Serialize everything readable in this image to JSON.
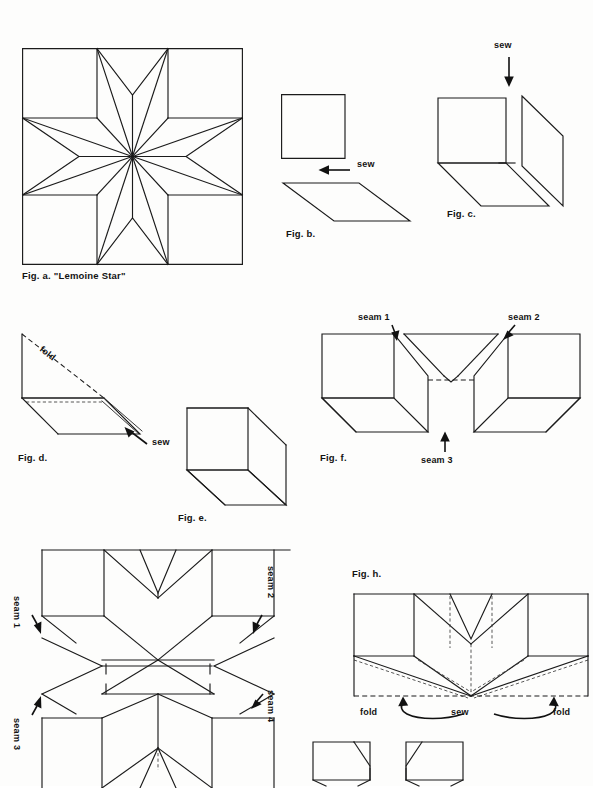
{
  "page": {
    "kind": "instructional-diagram-page",
    "width": 593,
    "height": 786,
    "background_color": "#fdfdfc",
    "ink_color": "#1b1b1b"
  },
  "figures": {
    "a": {
      "caption": "Fig. a. \"Lemoine Star\"",
      "description": "eight-pointed star block in a square with four corner squares and four edge triangles"
    },
    "b": {
      "caption": "Fig. b.",
      "labels": {
        "sew": "sew"
      },
      "description": "a square and a diamond to be joined"
    },
    "c": {
      "caption": "Fig. c.",
      "labels": {
        "sew": "sew"
      },
      "description": "square and diamond shown in three-dimensional folded position"
    },
    "d": {
      "caption": "Fig. d.",
      "labels": {
        "fold": "fold",
        "sew": "sew"
      },
      "description": "diamond folded along a diagonal dashed fold line and sewn"
    },
    "e": {
      "caption": "Fig. e.",
      "description": "completed three-dimensional corner unit"
    },
    "f": {
      "caption": "Fig. f.",
      "labels": {
        "seam1": "seam 1",
        "seam2": "seam 2",
        "seam3": "seam 3"
      },
      "description": "two units opened out showing three seams to be joined"
    },
    "g": {
      "caption": "",
      "labels": {
        "seam1": "seam 1",
        "seam2": "seam 2",
        "seam3": "seam 3",
        "seam4": "seam 4"
      },
      "description": "four units joined showing seams 1 through 4 around the block"
    },
    "h": {
      "caption": "Fig. h.",
      "labels": {
        "fold_left": "fold",
        "sew": "sew",
        "fold_right": "fold"
      },
      "description": "half block with dashed fold lines, folds at both sides and a centre seam"
    },
    "i": {
      "caption": "",
      "description": "two small partial square units at the lower edge, cut off by the page margin"
    }
  }
}
